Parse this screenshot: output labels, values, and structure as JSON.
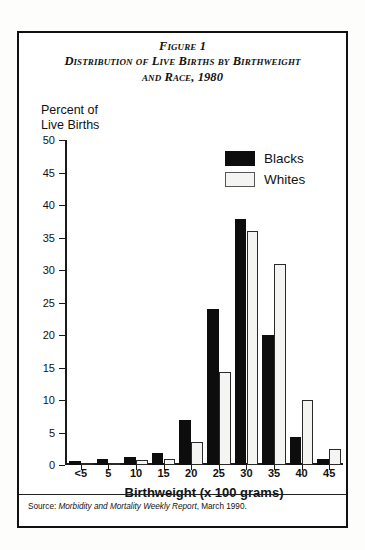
{
  "figure": {
    "title_lines": [
      "Figure 1",
      "Distribution of Live Births by Birthweight",
      "and Race, 1980"
    ],
    "y_axis_caption": "Percent of\nLive Births",
    "source_prefix": "Source: ",
    "source_italic": "Morbidity and Mortality Weekly Report",
    "source_suffix": ", March 1990."
  },
  "legend": {
    "position": "top-right-inside-plot",
    "items": [
      {
        "label": "Blacks",
        "color": "#0d0d0d",
        "style": "filled"
      },
      {
        "label": "Whites",
        "color": "#f4f4f2",
        "style": "outlined"
      }
    ]
  },
  "chart_data": {
    "type": "bar",
    "title": "Distribution of Live Births by Birthweight and Race, 1980",
    "subtitle": "Figure 1",
    "xlabel": "Birthweight (x 100 grams)",
    "ylabel": "Percent of Live Births",
    "categories": [
      "<5",
      "5",
      "10",
      "15",
      "20",
      "25",
      "30",
      "35",
      "40",
      "45"
    ],
    "series": [
      {
        "name": "Blacks",
        "color": "#0d0d0d",
        "values": [
          0.6,
          1.0,
          1.3,
          1.8,
          7.0,
          24.0,
          37.8,
          20.0,
          4.3,
          1.0
        ]
      },
      {
        "name": "Whites",
        "color": "#f4f4f2",
        "values": [
          0.2,
          0.3,
          0.7,
          1.0,
          3.5,
          14.3,
          36.0,
          31.0,
          10.0,
          2.5
        ]
      }
    ],
    "ylim": [
      0,
      50
    ],
    "yticks": [
      0,
      5,
      10,
      15,
      20,
      25,
      30,
      35,
      40,
      45,
      50
    ],
    "grid": false,
    "legend_position": "upper right"
  }
}
